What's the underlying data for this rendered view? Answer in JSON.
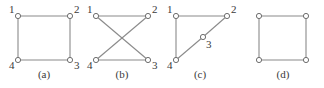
{
  "figure": {
    "width": 324,
    "height": 88,
    "background": "#ffffff",
    "edge_color": "#8a8a8a",
    "node_stroke_color": "#6e6e6e",
    "node_fill_color": "#ffffff",
    "label_color": "#3a3a3a",
    "node_radius": 2.6
  },
  "panels": [
    {
      "id": "a",
      "caption": "(a)",
      "caption_x": 44,
      "caption_y": 78,
      "nodes": [
        {
          "id": "1",
          "label": "1",
          "x": 18,
          "y": 16,
          "label_x": 9,
          "label_y": 13
        },
        {
          "id": "2",
          "label": "2",
          "x": 70,
          "y": 16,
          "label_x": 74,
          "label_y": 13
        },
        {
          "id": "3",
          "label": "3",
          "x": 70,
          "y": 60,
          "label_x": 74,
          "label_y": 69
        },
        {
          "id": "4",
          "label": "4",
          "x": 18,
          "y": 60,
          "label_x": 9,
          "label_y": 69
        }
      ],
      "edges": [
        {
          "from": "1",
          "to": "2"
        },
        {
          "from": "2",
          "to": "3"
        },
        {
          "from": "3",
          "to": "4"
        },
        {
          "from": "4",
          "to": "1"
        }
      ]
    },
    {
      "id": "b",
      "caption": "(b)",
      "caption_x": 122,
      "caption_y": 78,
      "nodes": [
        {
          "id": "1",
          "label": "1",
          "x": 96,
          "y": 16,
          "label_x": 87,
          "label_y": 13
        },
        {
          "id": "2",
          "label": "2",
          "x": 148,
          "y": 16,
          "label_x": 152,
          "label_y": 13
        },
        {
          "id": "3",
          "label": "3",
          "x": 148,
          "y": 60,
          "label_x": 152,
          "label_y": 69
        },
        {
          "id": "4",
          "label": "4",
          "x": 96,
          "y": 60,
          "label_x": 87,
          "label_y": 69
        }
      ],
      "edges": [
        {
          "from": "1",
          "to": "2"
        },
        {
          "from": "4",
          "to": "3"
        },
        {
          "from": "1",
          "to": "3"
        },
        {
          "from": "2",
          "to": "4"
        }
      ]
    },
    {
      "id": "c",
      "caption": "(c)",
      "caption_x": 200,
      "caption_y": 78,
      "nodes": [
        {
          "id": "1",
          "label": "1",
          "x": 176,
          "y": 16,
          "label_x": 167,
          "label_y": 13
        },
        {
          "id": "2",
          "label": "2",
          "x": 227,
          "y": 16,
          "label_x": 231,
          "label_y": 13
        },
        {
          "id": "3",
          "label": "3",
          "x": 203,
          "y": 37,
          "label_x": 206,
          "label_y": 48
        },
        {
          "id": "4",
          "label": "4",
          "x": 176,
          "y": 60,
          "label_x": 167,
          "label_y": 69
        }
      ],
      "edges": [
        {
          "from": "1",
          "to": "2"
        },
        {
          "from": "1",
          "to": "4"
        },
        {
          "from": "4",
          "to": "3"
        },
        {
          "from": "3",
          "to": "2"
        }
      ]
    },
    {
      "id": "d",
      "caption": "(d)",
      "caption_x": 283,
      "caption_y": 78,
      "nodes": [
        {
          "id": "tl",
          "label": "",
          "x": 259,
          "y": 16,
          "label_x": 0,
          "label_y": 0
        },
        {
          "id": "tr",
          "label": "",
          "x": 306,
          "y": 16,
          "label_x": 0,
          "label_y": 0
        },
        {
          "id": "br",
          "label": "",
          "x": 306,
          "y": 60,
          "label_x": 0,
          "label_y": 0
        },
        {
          "id": "bl",
          "label": "",
          "x": 259,
          "y": 60,
          "label_x": 0,
          "label_y": 0
        }
      ],
      "edges": [
        {
          "from": "tl",
          "to": "tr"
        },
        {
          "from": "tr",
          "to": "br"
        },
        {
          "from": "br",
          "to": "bl"
        },
        {
          "from": "bl",
          "to": "tl"
        }
      ]
    }
  ]
}
